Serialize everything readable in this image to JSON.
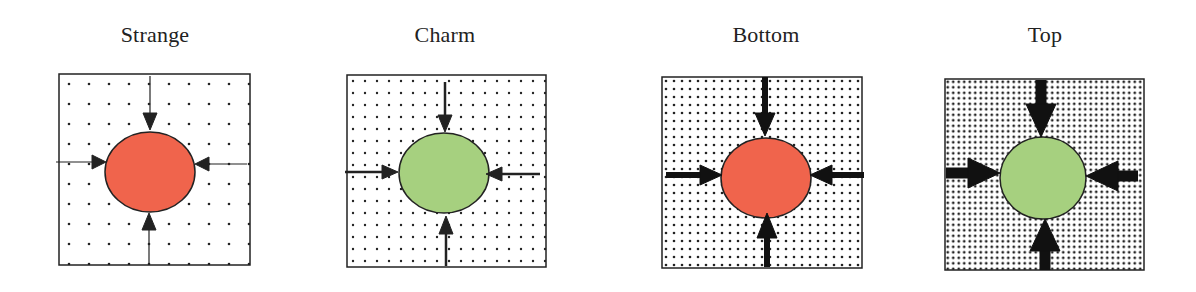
{
  "panels": [
    {
      "title": "Strange",
      "circle_color": "#f0644c",
      "dot_spacing": 20,
      "dot_radius": 1.3,
      "arrow_style": "thin"
    },
    {
      "title": "Charm",
      "circle_color": "#a6d07f",
      "dot_spacing": 12,
      "dot_radius": 1.2,
      "arrow_style": "medium"
    },
    {
      "title": "Bottom",
      "circle_color": "#f0644c",
      "dot_spacing": 8,
      "dot_radius": 1.3,
      "arrow_style": "thick"
    },
    {
      "title": "Top",
      "circle_color": "#a6d07f",
      "dot_spacing": 5.5,
      "dot_radius": 1.4,
      "arrow_style": "very-thick"
    }
  ]
}
